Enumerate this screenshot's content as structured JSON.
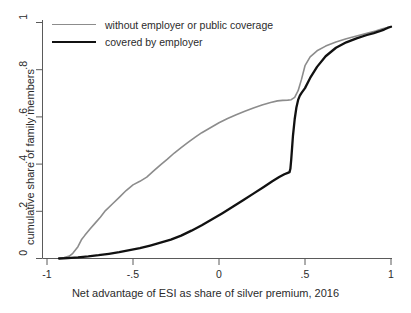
{
  "chart_data": {
    "type": "line",
    "title": "",
    "subtitle": "",
    "xlabel": "Net advantage of ESI as share of silver premium, 2016",
    "ylabel": "cumulative share of family members",
    "xlim": [
      -1,
      1
    ],
    "ylim": [
      0,
      1
    ],
    "grid": false,
    "legend_position": "top-left",
    "xticks": [
      -1,
      -0.5,
      0,
      0.5,
      1
    ],
    "xtick_labels": [
      "-1",
      "-.5",
      "0",
      ".5",
      "1"
    ],
    "yticks": [
      0,
      0.2,
      0.4,
      0.6,
      0.8,
      1
    ],
    "ytick_labels": [
      "0",
      ".2",
      ".4",
      ".6",
      ".8",
      "1"
    ],
    "colors": {
      "without_coverage": "#8c8c8c",
      "covered_by_employer": "#111111",
      "axis": "#5a5a5a",
      "background": "#ffffff"
    },
    "series": [
      {
        "name": "without employer or public coverage",
        "color": "#8c8c8c",
        "width": 1.6,
        "x": [
          -0.93,
          -0.9,
          -0.87,
          -0.85,
          -0.82,
          -0.8,
          -0.78,
          -0.75,
          -0.72,
          -0.69,
          -0.66,
          -0.62,
          -0.58,
          -0.54,
          -0.5,
          -0.46,
          -0.42,
          -0.38,
          -0.34,
          -0.3,
          -0.26,
          -0.22,
          -0.18,
          -0.14,
          -0.1,
          -0.05,
          0.0,
          0.05,
          0.1,
          0.15,
          0.2,
          0.25,
          0.3,
          0.34,
          0.37,
          0.4,
          0.42,
          0.44,
          0.46,
          0.48,
          0.5,
          0.53,
          0.57,
          0.62,
          0.68,
          0.74,
          0.8,
          0.86,
          0.91,
          0.95,
          0.98,
          1.0
        ],
        "y": [
          0.0,
          0.004,
          0.01,
          0.022,
          0.05,
          0.079,
          0.098,
          0.125,
          0.15,
          0.175,
          0.203,
          0.231,
          0.259,
          0.288,
          0.312,
          0.327,
          0.345,
          0.371,
          0.397,
          0.421,
          0.447,
          0.47,
          0.492,
          0.513,
          0.533,
          0.554,
          0.575,
          0.593,
          0.609,
          0.624,
          0.638,
          0.65,
          0.661,
          0.668,
          0.67,
          0.671,
          0.673,
          0.683,
          0.711,
          0.76,
          0.817,
          0.854,
          0.88,
          0.9,
          0.917,
          0.931,
          0.943,
          0.954,
          0.964,
          0.973,
          0.979,
          0.982
        ]
      },
      {
        "name": "covered by employer",
        "color": "#111111",
        "width": 2.3,
        "x": [
          -0.93,
          -0.88,
          -0.82,
          -0.76,
          -0.7,
          -0.64,
          -0.58,
          -0.52,
          -0.46,
          -0.4,
          -0.34,
          -0.28,
          -0.22,
          -0.16,
          -0.1,
          -0.04,
          0.02,
          0.08,
          0.14,
          0.2,
          0.26,
          0.31,
          0.35,
          0.38,
          0.4,
          0.41,
          0.415,
          0.42,
          0.425,
          0.43,
          0.44,
          0.45,
          0.46,
          0.47,
          0.48,
          0.5,
          0.53,
          0.57,
          0.62,
          0.68,
          0.74,
          0.8,
          0.86,
          0.9,
          0.93,
          0.96,
          0.98,
          1.0
        ],
        "y": [
          0.0,
          0.002,
          0.005,
          0.009,
          0.014,
          0.02,
          0.027,
          0.035,
          0.044,
          0.055,
          0.067,
          0.08,
          0.097,
          0.118,
          0.141,
          0.166,
          0.192,
          0.219,
          0.247,
          0.275,
          0.303,
          0.327,
          0.345,
          0.357,
          0.363,
          0.366,
          0.38,
          0.42,
          0.47,
          0.52,
          0.59,
          0.64,
          0.672,
          0.69,
          0.702,
          0.722,
          0.765,
          0.812,
          0.857,
          0.893,
          0.916,
          0.933,
          0.947,
          0.955,
          0.962,
          0.97,
          0.977,
          0.982
        ]
      }
    ]
  },
  "legend": {
    "items": [
      {
        "label": "without employer or public coverage"
      },
      {
        "label": "covered by employer"
      }
    ]
  },
  "axes": {
    "x_title": "Net advantage of ESI as share of silver premium, 2016",
    "y_title": "cumulative share of family members"
  }
}
